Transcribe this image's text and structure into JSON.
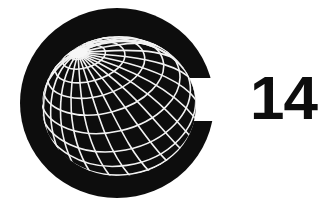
{
  "logo": {
    "name": "C14 logo",
    "letter_mark": "C",
    "numeral": "14",
    "globe_label": "wireframe globe",
    "colors": {
      "background": "#ffffff",
      "ink": "#0d0d0d",
      "mesh": "#f2f2f2"
    },
    "geometry": {
      "disc_center_x": 117,
      "disc_center_y": 103,
      "disc_radius_x": 97,
      "disc_radius_y": 95,
      "ring_thickness": 22,
      "gap_top_y": 78,
      "gap_bottom_y": 121,
      "globe_center_x": 119,
      "globe_center_y": 106,
      "globe_radius_x": 77,
      "globe_radius_y": 70,
      "pole_x": 78,
      "pole_y": 53,
      "meridian_count": 24,
      "parallel_count": 9,
      "numeral_x": 250,
      "numeral_y": 119
    }
  }
}
